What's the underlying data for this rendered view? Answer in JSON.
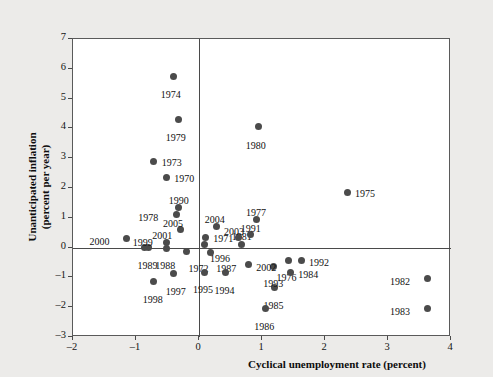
{
  "chart_data": {
    "type": "scatter",
    "title": "",
    "xlabel": "Cyclical unemployment rate (percent)",
    "ylabel": "Unanticipated inflation (percent per year)",
    "xlim": [
      -2,
      4
    ],
    "ylim": [
      -3,
      7
    ],
    "xticks": [
      "-2",
      "-1",
      "0",
      "1",
      "2",
      "3",
      "4"
    ],
    "xtick_values": [
      -2,
      -1,
      0,
      1,
      2,
      3,
      4
    ],
    "yticks": [
      "-3",
      "-2",
      "-1",
      "0",
      "1",
      "2",
      "3",
      "4",
      "5",
      "6",
      "7"
    ],
    "ytick_values": [
      -3,
      -2,
      -1,
      0,
      1,
      2,
      3,
      4,
      5,
      6,
      7
    ],
    "grid": false,
    "legend": null,
    "zero_lines": {
      "x": 0,
      "y": 0
    },
    "marker_color": "#4b4b4b",
    "points": [
      {
        "label": "1970",
        "x": -0.52,
        "y": 2.35,
        "lx": 8,
        "ly": -5
      },
      {
        "label": "1971",
        "x": 0.1,
        "y": 0.35,
        "lx": 8,
        "ly": -4
      },
      {
        "label": "1972",
        "x": -0.2,
        "y": -0.12,
        "lx": 2,
        "ly": 12
      },
      {
        "label": "1973",
        "x": -0.72,
        "y": 2.88,
        "lx": 8,
        "ly": -5
      },
      {
        "label": "1974",
        "x": -0.4,
        "y": 5.75,
        "lx": -13,
        "ly": 13
      },
      {
        "label": "1975",
        "x": 2.35,
        "y": 1.85,
        "lx": 8,
        "ly": -4
      },
      {
        "label": "1976",
        "x": 1.42,
        "y": -0.42,
        "lx": -12,
        "ly": 12
      },
      {
        "label": "1977",
        "x": 0.92,
        "y": 0.95,
        "lx": -11,
        "ly": -12
      },
      {
        "label": "1978",
        "x": -0.36,
        "y": 1.1,
        "lx": -38,
        "ly": -3
      },
      {
        "label": "1979",
        "x": -0.32,
        "y": 4.3,
        "lx": -13,
        "ly": 13
      },
      {
        "label": "1980",
        "x": 0.95,
        "y": 4.05,
        "lx": -13,
        "ly": 13
      },
      {
        "label": "1981",
        "x": 0.68,
        "y": 0.12,
        "lx": -10,
        "ly": -13
      },
      {
        "label": "1982",
        "x": 3.62,
        "y": -1.05,
        "lx": -37,
        "ly": -3
      },
      {
        "label": "1983",
        "x": 3.62,
        "y": -2.05,
        "lx": -37,
        "ly": -3
      },
      {
        "label": "1984",
        "x": 1.45,
        "y": -0.82,
        "lx": 8,
        "ly": -3
      },
      {
        "label": "1985",
        "x": 1.2,
        "y": -1.35,
        "lx": -11,
        "ly": 12
      },
      {
        "label": "1986",
        "x": 1.05,
        "y": -2.05,
        "lx": -11,
        "ly": 12
      },
      {
        "label": "1987",
        "x": 0.18,
        "y": -0.18,
        "lx": 6,
        "ly": 10
      },
      {
        "label": "1988",
        "x": -0.52,
        "y": -0.02,
        "lx": -11,
        "ly": 12
      },
      {
        "label": "1989",
        "x": -0.8,
        "y": 0.0,
        "lx": -11,
        "ly": 12
      },
      {
        "label": "1990",
        "x": -0.32,
        "y": 1.35,
        "lx": -10,
        "ly": -12
      },
      {
        "label": "1991",
        "x": 0.82,
        "y": 0.45,
        "lx": -10,
        "ly": -11
      },
      {
        "label": "1992",
        "x": 1.62,
        "y": -0.42,
        "lx": 8,
        "ly": -3
      },
      {
        "label": "1993",
        "x": 1.18,
        "y": -0.62,
        "lx": -10,
        "ly": 12
      },
      {
        "label": "1994",
        "x": 0.42,
        "y": -0.85,
        "lx": -11,
        "ly": 12
      },
      {
        "label": "1995",
        "x": 0.08,
        "y": -0.82,
        "lx": -11,
        "ly": 12
      },
      {
        "label": "1996",
        "x": 0.08,
        "y": 0.12,
        "lx": 6,
        "ly": 9
      },
      {
        "label": "1997",
        "x": -0.4,
        "y": -0.88,
        "lx": -8,
        "ly": 12
      },
      {
        "label": "1998",
        "x": -0.72,
        "y": -1.15,
        "lx": -11,
        "ly": 12
      },
      {
        "label": "1999",
        "x": -0.86,
        "y": 0.0,
        "lx": -12,
        "ly": -11
      },
      {
        "label": "2000",
        "x": -1.15,
        "y": 0.3,
        "lx": -37,
        "ly": -3
      },
      {
        "label": "2001",
        "x": -0.52,
        "y": 0.18,
        "lx": -14,
        "ly": -12
      },
      {
        "label": "2002",
        "x": 0.78,
        "y": -0.58,
        "lx": 8,
        "ly": -3
      },
      {
        "label": "2003",
        "x": 0.62,
        "y": 0.35,
        "lx": -14,
        "ly": -11
      },
      {
        "label": "2004",
        "x": 0.28,
        "y": 0.72,
        "lx": -12,
        "ly": -12
      },
      {
        "label": "2005",
        "x": -0.3,
        "y": 0.62,
        "lx": -17,
        "ly": -11
      }
    ]
  }
}
